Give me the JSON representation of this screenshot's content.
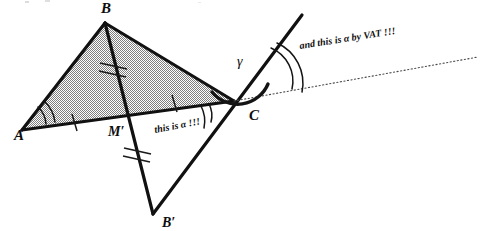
{
  "figure": {
    "background_color": "#ffffff",
    "ink_color": "#111111",
    "shade_color": "#8f8f8f",
    "dotted_color": "#4a4a4a"
  },
  "vertices": [
    {
      "id": "A",
      "label": "A",
      "x": 22,
      "y": 130,
      "label_x": 14,
      "label_y": 140
    },
    {
      "id": "B",
      "label": "B",
      "x": 105,
      "y": 23,
      "label_x": 101,
      "label_y": 13
    },
    {
      "id": "C",
      "label": "C",
      "x": 234,
      "y": 101,
      "label_x": 249,
      "label_y": 120
    },
    {
      "id": "M",
      "label": "M′",
      "x": 127,
      "y": 115,
      "label_x": 108,
      "label_y": 136
    },
    {
      "id": "Bp",
      "label": "B′",
      "x": 153,
      "y": 214,
      "label_x": 162,
      "label_y": 227
    }
  ],
  "angle_labels": [
    {
      "id": "gamma",
      "text": "γ",
      "x": 237,
      "y": 66
    }
  ],
  "annotations": [
    {
      "id": "alpha-at-c",
      "text": "this is α !!!",
      "x": 155,
      "y": 133,
      "rotation": -11,
      "font_size": 10
    },
    {
      "id": "alpha-by-vat",
      "text": "and this is α by VAT !!!",
      "x": 300,
      "y": 49,
      "rotation": -9,
      "font_size": 10
    }
  ],
  "segments": [
    {
      "id": "A-C",
      "from": "A",
      "to": "C",
      "style": "solid-thick"
    },
    {
      "id": "A-B",
      "from": "A",
      "to": "B",
      "style": "solid-thick"
    },
    {
      "id": "B-C",
      "from": "B",
      "to": "C",
      "style": "solid-thick"
    },
    {
      "id": "B-Bp",
      "from": "B",
      "to": "Bp",
      "style": "solid-thick"
    },
    {
      "id": "Bp-ray",
      "from": "Bp",
      "to": "ray-top",
      "style": "solid-thick"
    }
  ],
  "ray": {
    "id": "ray-through-C",
    "tip_x": 302,
    "tip_y": 15
  },
  "dotted_line": {
    "id": "extension-from-C",
    "from_x": 234,
    "from_y": 101,
    "to_x": 478,
    "to_y": 57
  },
  "tick_marks": [
    {
      "id": "tick-A-M",
      "count": 1,
      "on": "A-M′"
    },
    {
      "id": "tick-M-C",
      "count": 1,
      "on": "M′-C"
    },
    {
      "id": "tick-B-M",
      "count": 2,
      "on": "B-M′"
    },
    {
      "id": "tick-M-Bp",
      "count": 2,
      "on": "M′-B′"
    }
  ],
  "angle_marks": [
    {
      "id": "angle-A",
      "vertex": "A",
      "arcs": 2,
      "note": "alpha at A"
    },
    {
      "id": "angle-C-interior",
      "vertex": "C",
      "arcs": 2,
      "note": "alpha at C below AC"
    },
    {
      "id": "angle-C-gamma",
      "vertex": "C",
      "arcs": 1,
      "note": "gamma, thick arc"
    },
    {
      "id": "angle-vat",
      "vertex": "C",
      "arcs": 2,
      "note": "alpha by vertical angle theorem"
    }
  ]
}
